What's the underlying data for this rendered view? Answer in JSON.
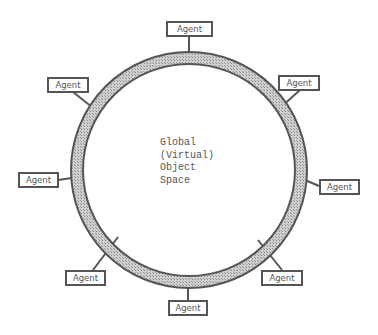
{
  "diagram": {
    "center_label": {
      "lines": [
        "Global",
        "(Virtual)",
        "Object",
        "Space"
      ]
    },
    "ring": {
      "cx": 189,
      "cy": 170,
      "outer_r": 118,
      "inner_r": 106,
      "fill": "#b8b8b8",
      "stroke": "#555555"
    },
    "agents": [
      {
        "label": "Agent",
        "position": "top"
      },
      {
        "label": "Agent",
        "position": "upper-left"
      },
      {
        "label": "Agent",
        "position": "upper-right"
      },
      {
        "label": "Agent",
        "position": "left"
      },
      {
        "label": "Agent",
        "position": "right"
      },
      {
        "label": "Agent",
        "position": "lower-left"
      },
      {
        "label": "Agent",
        "position": "bottom"
      },
      {
        "label": "Agent",
        "position": "lower-right"
      }
    ]
  }
}
